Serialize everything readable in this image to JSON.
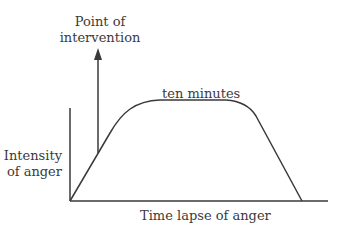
{
  "diagram": {
    "intervention_label_line1": "Point of",
    "intervention_label_line2": "intervention",
    "plateau_label": "ten minutes",
    "y_label_line1": "Intensity",
    "y_label_line2": "of anger",
    "x_label": "Time lapse of anger",
    "line_color": "#3a3a3a"
  }
}
